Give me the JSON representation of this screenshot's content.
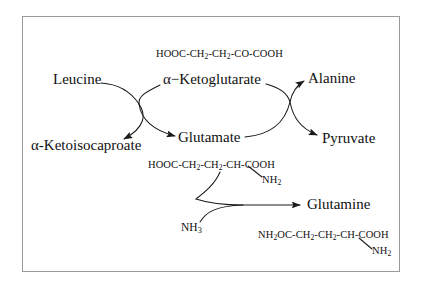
{
  "diagram": {
    "frame_color": "#9a9a9a",
    "line_color": "#1a1a1a",
    "background": "#ffffff",
    "nodes": {
      "leucine": "Leucine",
      "ketoisocaproate": "α-Ketoisocaproate",
      "ketoglutarate": "α−Ketoglutarate",
      "glutamate": "Glutamate",
      "alanine": "Alanine",
      "pyruvate": "Pyruvate",
      "glutamine": "Glutamine",
      "ammonia_prefix": "NH",
      "ammonia_sub": "3"
    },
    "formulas": {
      "ketoglutarate": {
        "parts": [
          {
            "t": "HOOC-CH",
            "sub": false
          },
          {
            "t": "2",
            "sub": true
          },
          {
            "t": "-CH",
            "sub": false
          },
          {
            "t": "2",
            "sub": true
          },
          {
            "t": "-CO-COOH",
            "sub": false
          }
        ]
      },
      "glutamate_main": {
        "parts": [
          {
            "t": "HOOC-CH",
            "sub": false
          },
          {
            "t": "2",
            "sub": true
          },
          {
            "t": "-CH",
            "sub": false
          },
          {
            "t": "2",
            "sub": true
          },
          {
            "t": "-CH-COOH",
            "sub": false
          }
        ]
      },
      "glutamate_amine": {
        "parts": [
          {
            "t": "NH",
            "sub": false
          },
          {
            "t": "2",
            "sub": true
          }
        ]
      },
      "glutamine_main": {
        "parts": [
          {
            "t": "NH",
            "sub": false
          },
          {
            "t": "2",
            "sub": true
          },
          {
            "t": "OC-CH",
            "sub": false
          },
          {
            "t": "2",
            "sub": true
          },
          {
            "t": "-CH",
            "sub": false
          },
          {
            "t": "2",
            "sub": true
          },
          {
            "t": "-CH-COOH",
            "sub": false
          }
        ]
      },
      "glutamine_amine": {
        "parts": [
          {
            "t": "NH",
            "sub": false
          },
          {
            "t": "2",
            "sub": true
          }
        ]
      }
    }
  }
}
